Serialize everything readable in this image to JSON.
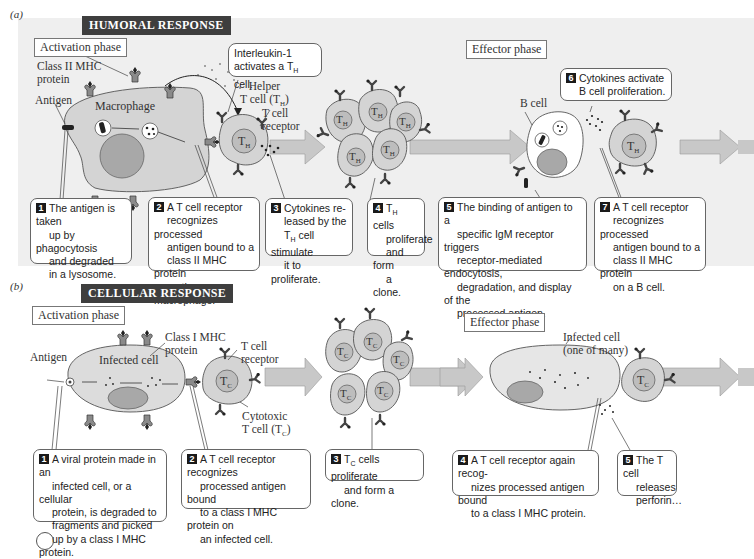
{
  "panel_a": {
    "letter": "(a)",
    "title": "HUMORAL RESPONSE",
    "activation_phase": "Activation phase",
    "effector_phase": "Effector phase",
    "labels": {
      "class_ii_mhc": "Class II MHC",
      "class_ii_mhc_2": "protein",
      "antigen": "Antigen",
      "macrophage": "Macrophage",
      "helper_1": "Helper",
      "helper_2": "T cell (T",
      "helper_sub": "H",
      "helper_3": ")",
      "tcr_1": "T cell",
      "tcr_2": "receptor",
      "b_cell": "B cell",
      "th_cell": "T",
      "th_sub": "H"
    },
    "interleukin_callout": {
      "line1": "Interleukin-1",
      "line2a": "activates a T",
      "line2sub": "H",
      "line2b": " cell."
    },
    "steps": [
      {
        "num": "1",
        "lines": [
          "The antigen is taken",
          "up by phagocytosis",
          "and degraded",
          "in a lysosome."
        ]
      },
      {
        "num": "2",
        "lines": [
          "A T cell receptor",
          "recognizes processed",
          "antigen bound to a",
          "class II MHC protein",
          "on the macrophage."
        ]
      },
      {
        "num": "3",
        "lines": [
          "Cytokines re-",
          "leased by the",
          "T cell stimulate",
          "it to proliferate."
        ],
        "sub_line": 2,
        "sub": "H"
      },
      {
        "num": "4",
        "lines": [
          "T cells",
          "proliferate",
          "and form",
          "a clone."
        ],
        "sub_line": 0,
        "sub": "H"
      },
      {
        "num": "5",
        "lines": [
          "The binding of antigen to a",
          "specific IgM receptor triggers",
          "receptor-mediated endocytosis,",
          "degradation, and display of the",
          "processed antigen."
        ]
      },
      {
        "num": "6",
        "lines": [
          "Cytokines activate",
          "B cell proliferation."
        ]
      },
      {
        "num": "7",
        "lines": [
          "A T cell receptor",
          "recognizes processed",
          "antigen bound to a",
          "class II MHC protein",
          "on a B cell."
        ]
      }
    ]
  },
  "panel_b": {
    "letter": "(b)",
    "title": "CELLULAR RESPONSE",
    "activation_phase": "Activation phase",
    "effector_phase": "Effector phase",
    "labels": {
      "class_i_mhc": "Class I MHC",
      "class_i_mhc_2": "protein",
      "antigen": "Antigen",
      "infected_cell": "Infected cell",
      "tcr_1": "T cell",
      "tcr_2": "receptor",
      "cytotoxic_1": "Cytotoxic",
      "cytotoxic_2": "T cell (T",
      "cytotoxic_sub": "C",
      "cytotoxic_3": ")",
      "infected_many_1": "Infected cell",
      "infected_many_2": "(one of many)",
      "tc_cell": "T",
      "tc_sub": "C"
    },
    "steps": [
      {
        "num": "1",
        "lines": [
          "A viral protein made in an",
          "infected cell, or a cellular",
          "protein, is degraded to",
          "fragments and picked",
          "up by a class I MHC protein."
        ]
      },
      {
        "num": "2",
        "lines": [
          "A T cell receptor recognizes",
          "processed antigen bound",
          "to a class I MHC protein on",
          "an infected cell."
        ]
      },
      {
        "num": "3",
        "lines": [
          "T cells proliferate",
          "and form a clone."
        ],
        "sub_line": 0,
        "sub": "C"
      },
      {
        "num": "4",
        "lines": [
          "A T cell receptor again recog-",
          "nizes processed antigen bound",
          "to a class I MHC protein."
        ]
      },
      {
        "num": "5",
        "lines": [
          "The T cell",
          "releases",
          "perforin…"
        ]
      }
    ]
  },
  "colors": {
    "panel_bg": "#efefef",
    "cell_fill": "#d4d4d4",
    "nucleus_fill": "#a8a8a8",
    "arrow_fill": "#c8c8c8",
    "title_bg": "#3e3e3e"
  }
}
